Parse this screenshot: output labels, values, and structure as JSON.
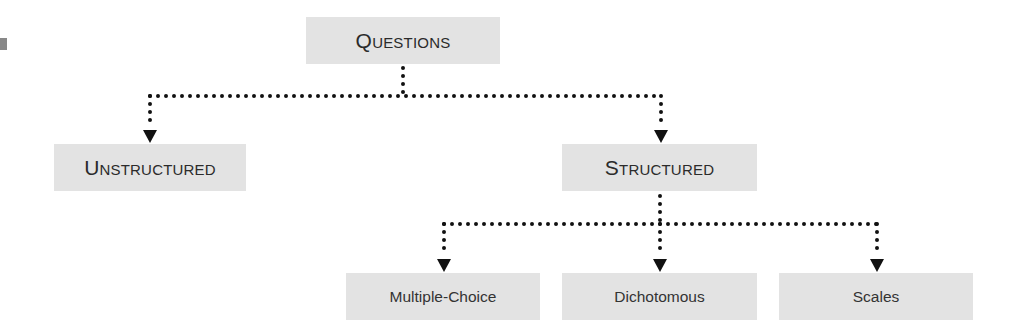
{
  "diagram": {
    "type": "tree",
    "root": {
      "label": "Questions",
      "children": [
        {
          "label": "Unstructured",
          "children": []
        },
        {
          "label": "Structured",
          "children": [
            {
              "label": "Multiple-Choice"
            },
            {
              "label": "Dichotomous"
            },
            {
              "label": "Scales"
            }
          ]
        }
      ]
    },
    "nodes": {
      "questions": "Questions",
      "unstructured": "Unstructured",
      "structured": "Structured",
      "multiple_choice": "Multiple-Choice",
      "dichotomous": "Dichotomous",
      "scales": "Scales"
    },
    "edges": [
      [
        "Questions",
        "Unstructured"
      ],
      [
        "Questions",
        "Structured"
      ],
      [
        "Structured",
        "Multiple-Choice"
      ],
      [
        "Structured",
        "Dichotomous"
      ],
      [
        "Structured",
        "Scales"
      ]
    ],
    "colors": {
      "box_fill": "#e3e3e3",
      "text": "#2b2b2b",
      "connector": "#111111"
    }
  }
}
